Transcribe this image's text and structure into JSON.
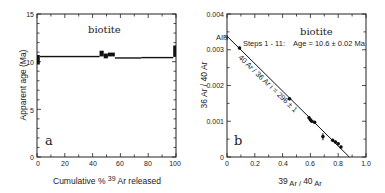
{
  "chart_data": [
    {
      "panel": "a",
      "type": "line",
      "subtype": "age-spectrum step plot",
      "title": "biotite",
      "xlabel": "Cumulative % 39 Ar released",
      "xlabel_parts": {
        "pre": "Cumulative % ",
        "sup": "39",
        "post": " Ar released"
      },
      "ylabel": "Apparent age (Ma)",
      "xlim": [
        0,
        100
      ],
      "ylim": [
        0,
        15
      ],
      "xticks": [
        0,
        20,
        40,
        60,
        80,
        100
      ],
      "yticks": [
        0,
        5,
        10,
        15
      ],
      "grid": false,
      "steps": [
        {
          "x0": 0,
          "x1": 2,
          "age": 10.2,
          "err": 0.5
        },
        {
          "x0": 2,
          "x1": 45,
          "age": 10.55,
          "err": 0.06
        },
        {
          "x0": 45,
          "x1": 48,
          "age": 10.85,
          "err": 0.3
        },
        {
          "x0": 48,
          "x1": 51,
          "age": 10.6,
          "err": 0.25
        },
        {
          "x0": 51,
          "x1": 56,
          "age": 10.75,
          "err": 0.2
        },
        {
          "x0": 56,
          "x1": 75,
          "age": 10.4,
          "err": 0.06
        },
        {
          "x0": 75,
          "x1": 98,
          "age": 10.45,
          "err": 0.05
        },
        {
          "x0": 98,
          "x1": 100,
          "age": 11.1,
          "err": 0.6
        }
      ]
    },
    {
      "panel": "b",
      "type": "scatter",
      "subtype": "inverse isochron",
      "title": "biotite",
      "annotation": "Steps 1 - 11:   Age = 10.6 ± 0.02 Ma",
      "line_label": "40 Ar / 36 Ar i = 296 ± 1",
      "air_label": "AIR",
      "xlabel": "39 Ar / 40 Ar",
      "ylabel": "36 Ar / 40 Ar",
      "xlim": [
        0,
        1.0
      ],
      "ylim": [
        0,
        0.004
      ],
      "xticks": [
        0,
        0.2,
        0.4,
        0.6,
        0.8,
        1.0
      ],
      "yticks": [
        0,
        0.001,
        0.002,
        0.003,
        0.004
      ],
      "grid": false,
      "isochron_line": {
        "x": [
          0,
          0.88
        ],
        "y": [
          0.00338,
          0
        ]
      },
      "points": [
        {
          "x": 0.09,
          "y": 0.00305,
          "err": 4e-05
        },
        {
          "x": 0.45,
          "y": 0.00163,
          "err": 4e-05
        },
        {
          "x": 0.59,
          "y": 0.0011,
          "err": 5e-05
        },
        {
          "x": 0.6,
          "y": 0.00104,
          "err": 5e-05
        },
        {
          "x": 0.61,
          "y": 0.001,
          "err": 4e-05
        },
        {
          "x": 0.63,
          "y": 0.00097,
          "err": 4e-05
        },
        {
          "x": 0.69,
          "y": 0.00057,
          "err": 0.0001
        },
        {
          "x": 0.76,
          "y": 0.00047,
          "err": 4e-05
        },
        {
          "x": 0.78,
          "y": 0.00042,
          "err": 4e-05
        },
        {
          "x": 0.8,
          "y": 0.00037,
          "err": 4e-05
        },
        {
          "x": 0.82,
          "y": 0.00028,
          "err": 4e-05
        }
      ]
    }
  ],
  "panels": {
    "a": {
      "letter": "a",
      "title": "biotite",
      "ylabel": "Apparent age (Ma)",
      "xlabel_pre": "Cumulative % ",
      "xlabel_sup": "39",
      "xlabel_post": " Ar released",
      "ytick_labels": [
        "0",
        "5",
        "10",
        "15"
      ],
      "xtick_labels": [
        "0",
        "20",
        "40",
        "60",
        "80",
        "100"
      ]
    },
    "b": {
      "letter": "b",
      "title": "biotite",
      "annotation_steps": "Steps 1 - 11:",
      "annotation_age": "Age = 10.6 ± 0.02 Ma",
      "air_label": "AIR",
      "line_label": "40 Ar / 36 Ar i = 296 ± 1",
      "ylabel": "36 Ar / 40 Ar",
      "xlabel_sup1": "39",
      "xlabel_mid": " Ar / ",
      "xlabel_sup2": "40",
      "xlabel_end": " Ar",
      "ytick_labels": [
        "0",
        "0.001",
        "0.002",
        "0.003",
        "0.004"
      ],
      "xtick_labels": [
        "0",
        "0.2",
        "0.4",
        "0.6",
        "0.8",
        "1.0"
      ]
    }
  }
}
